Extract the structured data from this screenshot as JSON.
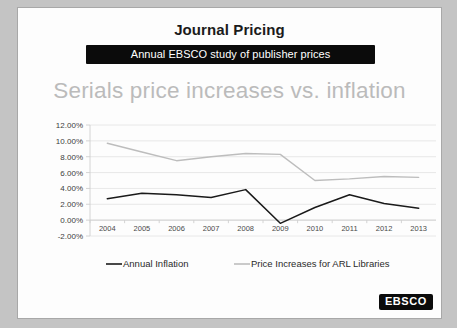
{
  "slide": {
    "title": "Journal Pricing",
    "subtitle": "Annual EBSCO study of publisher prices",
    "headline": "Serials price increases vs. inflation",
    "logo": "EBSCO"
  },
  "colors": {
    "inflation_line": "#1a1a1a",
    "arl_line": "#bdbdbd",
    "headline": "#bbbbbb",
    "subtitle_bar": "#0b0b0b",
    "slide_background": "#fdfdfd",
    "gridline": "#e2e2e2"
  },
  "chart_data": {
    "type": "line",
    "title": "Serials price increases vs. inflation",
    "xlabel": "",
    "ylabel": "",
    "x": [
      "2004",
      "2005",
      "2006",
      "2007",
      "2008",
      "2009",
      "2010",
      "2011",
      "2012",
      "2013"
    ],
    "categories": [
      "2004",
      "2005",
      "2006",
      "2007",
      "2008",
      "2009",
      "2010",
      "2011",
      "2012",
      "2013"
    ],
    "ylim": [
      -2,
      12
    ],
    "yticks": [
      12,
      10,
      8,
      6,
      4,
      2,
      0,
      -2
    ],
    "ytick_labels": [
      "12.00%",
      "10.00%",
      "8.00%",
      "6.00%",
      "4.00%",
      "2.00%",
      "0.00%",
      "-2.00%"
    ],
    "grid": true,
    "legend_position": "bottom",
    "series": [
      {
        "name": "Annual Inflation",
        "color": "#1a1a1a",
        "values": [
          2.7,
          3.4,
          3.2,
          2.85,
          3.85,
          -0.4,
          1.6,
          3.2,
          2.1,
          1.5
        ]
      },
      {
        "name": "Price Increases for ARL Libraries",
        "color": "#bdbdbd",
        "values": [
          9.7,
          8.6,
          7.5,
          8.0,
          8.4,
          8.3,
          5.0,
          5.2,
          5.5,
          5.4
        ]
      }
    ]
  }
}
